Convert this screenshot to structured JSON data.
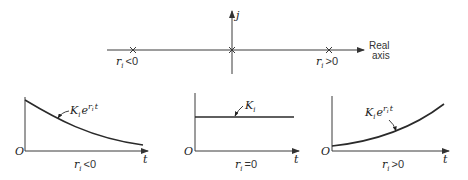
{
  "complex_plane": {
    "vertical_axis_label": "j",
    "horizontal_axis_label_line1": "Real",
    "horizontal_axis_label_line2": "axis",
    "roots": [
      {
        "label_var": "r",
        "label_sub": "i",
        "label_rel": "<0",
        "position": "left"
      },
      {
        "label_var": "",
        "label_sub": "",
        "label_rel": "",
        "position": "origin"
      },
      {
        "label_var": "r",
        "label_sub": "i",
        "label_rel": ">0",
        "position": "right"
      }
    ]
  },
  "graphs": [
    {
      "name": "decaying",
      "origin_label": "O",
      "x_axis_label": "t",
      "curve_label_K": "K",
      "curve_label_sub": "i",
      "curve_label_e": "e",
      "curve_label_exp": "r",
      "curve_label_exp_sub": "i",
      "curve_label_exp_t": "t",
      "condition_var": "r",
      "condition_sub": "i",
      "condition_rel": "<0"
    },
    {
      "name": "constant",
      "origin_label": "O",
      "x_axis_label": "t",
      "curve_label_K": "K",
      "curve_label_sub": "i",
      "condition_var": "r",
      "condition_sub": "i",
      "condition_rel": "=0"
    },
    {
      "name": "growing",
      "origin_label": "O",
      "x_axis_label": "t",
      "curve_label_K": "K",
      "curve_label_sub": "i",
      "curve_label_e": "e",
      "curve_label_exp": "r",
      "curve_label_exp_sub": "i",
      "curve_label_exp_t": "t",
      "condition_var": "r",
      "condition_sub": "i",
      "condition_rel": ">0"
    }
  ]
}
